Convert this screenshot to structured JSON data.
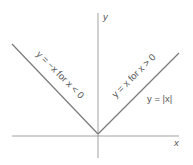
{
  "diagram": {
    "axes": {
      "x_label": "x",
      "y_label": "y"
    },
    "labels": {
      "left_branch": "y = −x for x < 0",
      "right_branch": "y = x for x > 0",
      "function": "y = |x|"
    },
    "colors": {
      "axis": "#8a8a8a",
      "graph": "#7a7a7a",
      "text": "#555555"
    }
  }
}
